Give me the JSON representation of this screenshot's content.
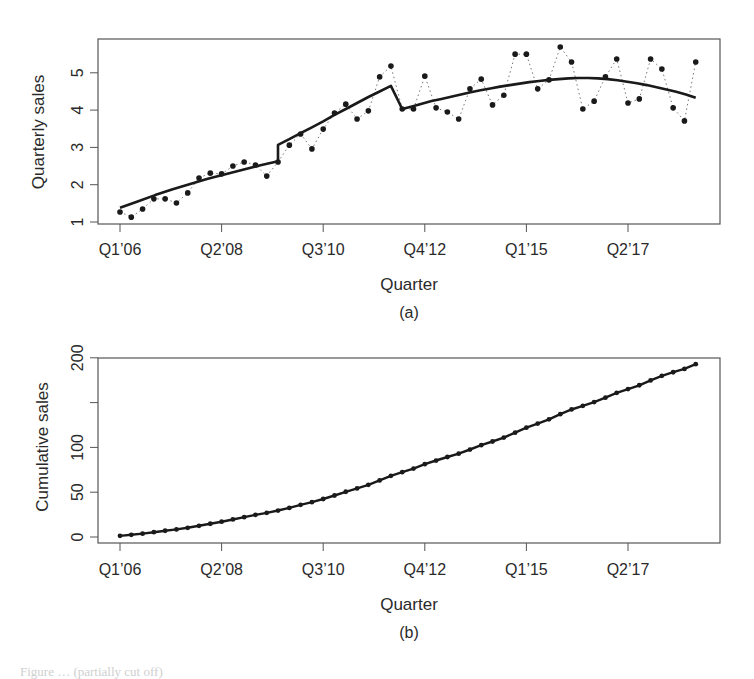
{
  "figure": {
    "panels": [
      {
        "id": "a",
        "sublabel": "(a)",
        "ylabel": "Quarterly sales",
        "xlabel": "Quarter",
        "yticks": [
          "1",
          "2",
          "3",
          "4",
          "5"
        ],
        "xticks": [
          "Q1’06",
          "Q2’08",
          "Q3’10",
          "Q4’12",
          "Q1’15",
          "Q2’17"
        ]
      },
      {
        "id": "b",
        "sublabel": "(b)",
        "ylabel": "Cumulative sales",
        "xlabel": "Quarter",
        "yticks": [
          "0",
          "50",
          "100",
          "",
          "200"
        ],
        "xticks": [
          "Q1’06",
          "Q2’08",
          "Q3’10",
          "Q4’12",
          "Q1’15",
          "Q2’17"
        ]
      }
    ],
    "colors": {
      "ink": "#1a1a1a",
      "axis": "#555555",
      "background": "#ffffff"
    }
  },
  "chart_data": [
    {
      "type": "scatter",
      "title": "(a)",
      "xlabel": "Quarter",
      "ylabel": "Quarterly sales",
      "ylim": [
        0.9,
        5.85
      ],
      "yticks": [
        1,
        2,
        3,
        4,
        5
      ],
      "xtick_labels": [
        "Q1'06",
        "Q2'08",
        "Q3'10",
        "Q4'12",
        "Q1'15",
        "Q2'17"
      ],
      "xtick_positions": [
        0,
        9,
        18,
        27,
        36,
        45
      ],
      "grid": false,
      "x": [
        "Q1'06",
        "Q2'06",
        "Q3'06",
        "Q4'06",
        "Q1'07",
        "Q2'07",
        "Q3'07",
        "Q4'07",
        "Q1'08",
        "Q2'08",
        "Q3'08",
        "Q4'08",
        "Q1'09",
        "Q2'09",
        "Q3'09",
        "Q4'09",
        "Q1'10",
        "Q2'10",
        "Q3'10",
        "Q4'10",
        "Q1'11",
        "Q2'11",
        "Q3'11",
        "Q4'11",
        "Q1'12",
        "Q2'12",
        "Q3'12",
        "Q4'12",
        "Q1'13",
        "Q2'13",
        "Q3'13",
        "Q4'13",
        "Q1'14",
        "Q2'14",
        "Q3'14",
        "Q4'14",
        "Q1'15",
        "Q2'15",
        "Q3'15",
        "Q4'15",
        "Q1'16",
        "Q2'16",
        "Q3'16",
        "Q4'16",
        "Q1'17",
        "Q2'17",
        "Q3'17",
        "Q4'17",
        "Q1'18",
        "Q2'18",
        "Q3'18",
        "Q4'18"
      ],
      "series": [
        {
          "name": "Quarterly sales (observed)",
          "style": "points joined by dotted line",
          "values": [
            1.27,
            1.13,
            1.35,
            1.62,
            1.62,
            1.51,
            1.78,
            2.18,
            2.31,
            2.29,
            2.5,
            2.61,
            2.53,
            2.23,
            2.61,
            3.06,
            3.36,
            2.96,
            3.49,
            3.92,
            4.16,
            3.76,
            3.98,
            4.89,
            5.18,
            4.03,
            4.03,
            4.91,
            4.06,
            3.95,
            3.76,
            4.57,
            4.83,
            4.14,
            4.4,
            5.5,
            5.5,
            4.57,
            4.81,
            5.69,
            5.29,
            4.03,
            4.24,
            4.89,
            5.37,
            4.19,
            4.3,
            5.37,
            5.1,
            4.06,
            3.71,
            5.29
          ]
        },
        {
          "name": "Fitted trend (piecewise)",
          "style": "solid thick line",
          "segments": [
            {
              "x_index": [
                0,
                14
              ],
              "values": [
                1.38,
                1.55,
                1.72,
                1.88,
                2.02,
                2.16,
                2.28,
                2.4,
                2.52,
                2.63
              ]
            },
            {
              "x_index": [
                14,
                24
              ],
              "values": [
                3.07,
                3.22,
                3.38,
                3.54,
                3.7,
                3.87,
                4.03,
                4.19,
                4.35,
                4.5,
                4.65
              ]
            },
            {
              "x_index": [
                25,
                51
              ],
              "values": [
                4.03,
                4.1,
                4.17,
                4.24,
                4.3,
                4.36,
                4.42,
                4.48,
                4.53,
                4.58,
                4.63,
                4.67,
                4.71,
                4.75,
                4.78,
                4.81,
                4.83,
                4.85,
                4.86,
                4.86,
                4.85,
                4.83,
                4.8,
                4.76,
                4.72,
                4.67,
                4.61,
                4.55,
                4.49,
                4.42,
                4.33
              ]
            }
          ]
        }
      ]
    },
    {
      "type": "line",
      "title": "(b)",
      "xlabel": "Quarter",
      "ylabel": "Cumulative sales",
      "ylim": [
        -6,
        200
      ],
      "yticks": [
        0,
        50,
        100,
        150,
        200
      ],
      "ytick_labels": [
        "0",
        "50",
        "100",
        "",
        "200"
      ],
      "xtick_labels": [
        "Q1'06",
        "Q2'08",
        "Q3'10",
        "Q4'12",
        "Q1'15",
        "Q2'17"
      ],
      "xtick_positions": [
        0,
        9,
        18,
        27,
        36,
        45
      ],
      "grid": false,
      "series": [
        {
          "name": "Cumulative sales",
          "style": "solid line with point markers",
          "values": "running sum of panel (a) observed values (ends near 191)"
        }
      ]
    }
  ],
  "caption": "Figure … (partially cut off)"
}
